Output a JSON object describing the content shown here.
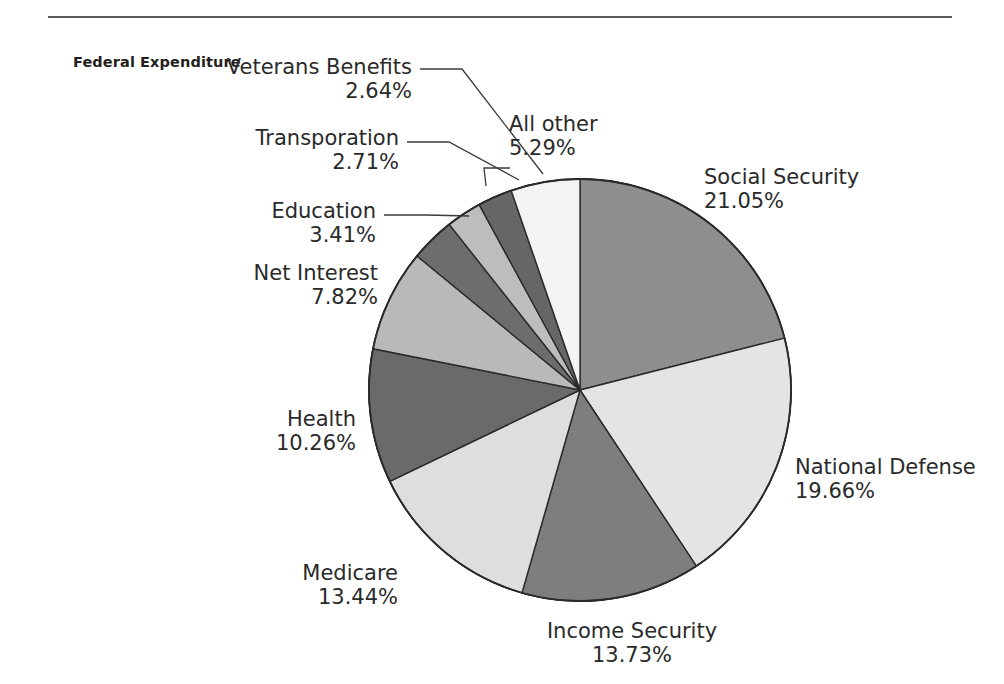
{
  "series_title": "Federal Expenditure",
  "chart_data": {
    "type": "pie",
    "title": "Federal Expenditure",
    "unit": "%",
    "total": 100,
    "start_angle_deg": 0,
    "direction": "clockwise",
    "legend": "none",
    "labels_position": "outside-with-leader-lines",
    "categories": [
      "Social Security",
      "National Defense",
      "Income Security",
      "Medicare",
      "Health",
      "Net Interest",
      "Education",
      "Transporation",
      "Veterans Benefits",
      "All other"
    ],
    "values": [
      21.05,
      19.66,
      13.73,
      13.44,
      10.26,
      7.82,
      3.41,
      2.71,
      2.64,
      5.29
    ],
    "value_labels": [
      "21.05%",
      "19.66%",
      "13.73%",
      "13.44%",
      "10.26%",
      "7.82%",
      "3.41%",
      "2.71%",
      "2.64%",
      "5.29%"
    ],
    "colors": [
      "#8e8e8e",
      "#e4e4e4",
      "#7e7e7e",
      "#dedede",
      "#6a6a6a",
      "#b9b9b9",
      "#6d6d6d",
      "#bdbdbd",
      "#666666",
      "#f4f4f4"
    ],
    "slice_border_color": "#2a2a2a",
    "slices": [
      {
        "name": "Social Security",
        "value": 21.05,
        "value_label": "21.05%",
        "color": "#8e8e8e"
      },
      {
        "name": "National Defense",
        "value": 19.66,
        "value_label": "19.66%",
        "color": "#e4e4e4"
      },
      {
        "name": "Income Security",
        "value": 13.73,
        "value_label": "13.73%",
        "color": "#7e7e7e"
      },
      {
        "name": "Medicare",
        "value": 13.44,
        "value_label": "13.44%",
        "color": "#dedede"
      },
      {
        "name": "Health",
        "value": 10.26,
        "value_label": "10.26%",
        "color": "#6a6a6a"
      },
      {
        "name": "Net Interest",
        "value": 7.82,
        "value_label": "7.82%",
        "color": "#b9b9b9"
      },
      {
        "name": "Education",
        "value": 3.41,
        "value_label": "3.41%",
        "color": "#6d6d6d"
      },
      {
        "name": "Transporation",
        "value": 2.71,
        "value_label": "2.71%",
        "color": "#bdbdbd"
      },
      {
        "name": "Veterans Benefits",
        "value": 2.64,
        "value_label": "2.64%",
        "color": "#666666"
      },
      {
        "name": "All other",
        "value": 5.29,
        "value_label": "5.29%",
        "color": "#f4f4f4"
      }
    ]
  },
  "labels": {
    "social_security": {
      "name": "Social Security",
      "pct": "21.05%"
    },
    "national_defense": {
      "name": "National Defense",
      "pct": "19.66%"
    },
    "income_security": {
      "name": "Income Security",
      "pct": "13.73%"
    },
    "medicare": {
      "name": "Medicare",
      "pct": "13.44%"
    },
    "health": {
      "name": "Health",
      "pct": "10.26%"
    },
    "net_interest": {
      "name": "Net Interest",
      "pct": "7.82%"
    },
    "education": {
      "name": "Education",
      "pct": "3.41%"
    },
    "transporation": {
      "name": "Transporation",
      "pct": "2.71%"
    },
    "veterans_benefits": {
      "name": "Veterans Benefits",
      "pct": "2.64%"
    },
    "all_other": {
      "name": "All other",
      "pct": "5.29%"
    }
  }
}
